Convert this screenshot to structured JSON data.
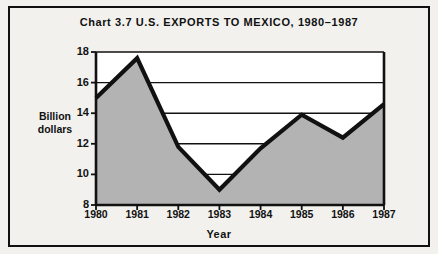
{
  "chart_data": {
    "type": "area",
    "title": "Chart 3.7   U.S. EXPORTS TO MEXICO, 1980–1987",
    "xlabel": "Year",
    "ylabel": "Billion dollars",
    "categories": [
      "1980",
      "1981",
      "1982",
      "1983",
      "1984",
      "1985",
      "1986",
      "1987"
    ],
    "values": [
      15.0,
      17.6,
      11.8,
      9.0,
      11.7,
      13.9,
      12.4,
      14.6
    ],
    "ylim": [
      8,
      18
    ],
    "yticks": [
      8,
      10,
      12,
      14,
      16,
      18
    ],
    "ytick_labels": [
      "8",
      "10",
      "12",
      "14",
      "16",
      "18"
    ],
    "grid": true,
    "legend": false,
    "series_name": "U.S. exports to Mexico",
    "colors": {
      "line": "#111111",
      "fill": "#b3b3b3",
      "axis": "#111111",
      "background": "#f2f1ee",
      "plot_background": "#ffffff"
    }
  },
  "figure": {
    "title_lines": {
      "label": "Chart 3.7",
      "heading": "U.S. EXPORTS TO MEXICO, 1980–1987"
    },
    "y_axis_caption_line1": "Billion",
    "y_axis_caption_line2": "dollars"
  }
}
